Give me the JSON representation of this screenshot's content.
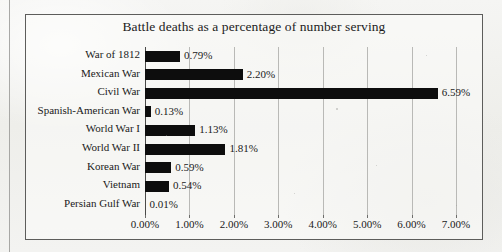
{
  "chart_data": {
    "type": "bar",
    "orientation": "horizontal",
    "title": "Battle deaths as a percentage of number serving",
    "xlabel": "",
    "ylabel": "",
    "categories": [
      "War of 1812",
      "Mexican War",
      "Civil War",
      "Spanish-American War",
      "World War I",
      "World War II",
      "Korean War",
      "Vietnam",
      "Persian Gulf War"
    ],
    "values": [
      0.79,
      2.2,
      6.59,
      0.13,
      1.13,
      1.81,
      0.59,
      0.54,
      0.01
    ],
    "value_labels": [
      "0.79%",
      "2.20%",
      "6.59%",
      "0.13%",
      "1.13%",
      "1.81%",
      "0.59%",
      "0.54%",
      "0.01%"
    ],
    "xlim": [
      0,
      7
    ],
    "xticks": [
      0,
      1,
      2,
      3,
      4,
      5,
      6,
      7
    ],
    "xtick_labels": [
      "0.00%",
      "1.00%",
      "2.00%",
      "3.00%",
      "4.00%",
      "5.00%",
      "6.00%",
      "7.00%"
    ],
    "grid": "vertical",
    "legend": "none",
    "bar_color": "#0d0d0d",
    "gridline_color": "#b9b9b6",
    "background_color": "#f3f3f1",
    "border_color": "#5d5d5b"
  }
}
